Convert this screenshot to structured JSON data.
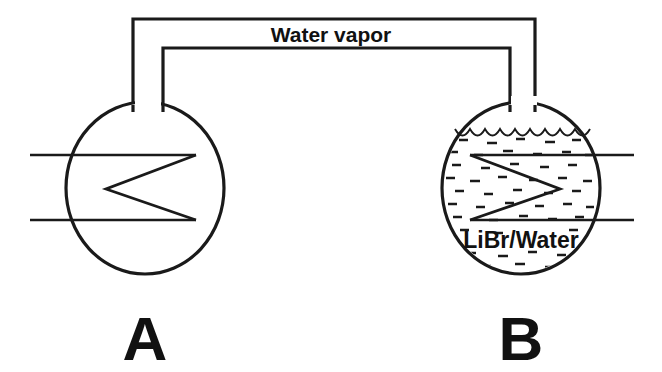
{
  "figure": {
    "type": "schematic-diagram",
    "background_color": "#ffffff",
    "line_color": "#1a1a1a",
    "text_color": "#111111"
  },
  "connection": {
    "label": "Water vapor",
    "label_x": 331,
    "label_y": 34
  },
  "vessels": [
    {
      "id": "A",
      "letter": "A",
      "letter_x": 145,
      "letter_y": 345,
      "center_x": 145,
      "center_y": 188,
      "radius_x": 79,
      "radius_y": 86,
      "contents": "",
      "filled": false,
      "has_liquid_surface": false,
      "coil_direction": "left",
      "pipe_side": "left",
      "pipe_top_y": 155,
      "pipe_bottom_y": 220
    },
    {
      "id": "B",
      "letter": "B",
      "letter_x": 521,
      "letter_y": 345,
      "center_x": 521,
      "center_y": 188,
      "radius_x": 79,
      "radius_y": 86,
      "contents": "LiBr/Water",
      "contents_x": 521,
      "contents_y": 241,
      "filled": true,
      "has_liquid_surface": true,
      "liquid_surface_y": 131,
      "coil_direction": "right",
      "pipe_side": "right",
      "pipe_top_y": 155,
      "pipe_bottom_y": 220
    }
  ],
  "labels": {
    "vapor": "Water vapor",
    "solution": "LiBr/Water",
    "vessel_a": "A",
    "vessel_b": "B"
  }
}
